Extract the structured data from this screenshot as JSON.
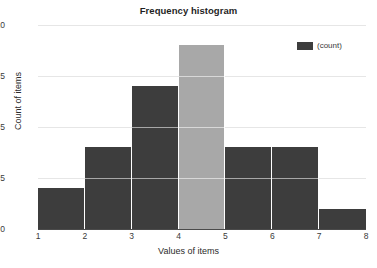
{
  "chart_data": {
    "type": "bar",
    "title": "Frequency histogram",
    "xlabel": "Values of items",
    "ylabel": "Count of items",
    "categories": [
      "1-2",
      "2-3",
      "3-4",
      "4-5",
      "5-6",
      "6-7",
      "7-8"
    ],
    "bin_edges": [
      1,
      2,
      3,
      4,
      5,
      6,
      7,
      8
    ],
    "values": [
      2,
      4,
      7,
      9,
      4,
      4,
      1
    ],
    "bar_colors": [
      "#3d3d3d",
      "#3d3d3d",
      "#3d3d3d",
      "#a8a8a8",
      "#3d3d3d",
      "#3d3d3d",
      "#3d3d3d"
    ],
    "highlighted_bin_index": 3,
    "xlim": [
      1,
      8
    ],
    "ylim": [
      0,
      10
    ],
    "x_ticks": [
      "1",
      "2",
      "3",
      "4",
      "5",
      "6",
      "7",
      "8"
    ],
    "x_tick_values": [
      1,
      2,
      3,
      4,
      5,
      6,
      7,
      8
    ],
    "y_ticks": [
      "0",
      "2.5",
      "5",
      "7.5",
      "10"
    ],
    "y_tick_values": [
      0,
      2.5,
      5,
      7.5,
      10
    ],
    "grid": true,
    "legend": {
      "position": "top-right",
      "entries": [
        {
          "label": "(count)",
          "color": "#3d3d3d"
        }
      ]
    },
    "colors": {
      "bar_default": "#3d3d3d",
      "bar_highlight": "#a8a8a8",
      "gridline": "#e6e6e6",
      "axis": "#4a4a4a",
      "text": "#2b2b2b",
      "background": "#ffffff"
    }
  }
}
